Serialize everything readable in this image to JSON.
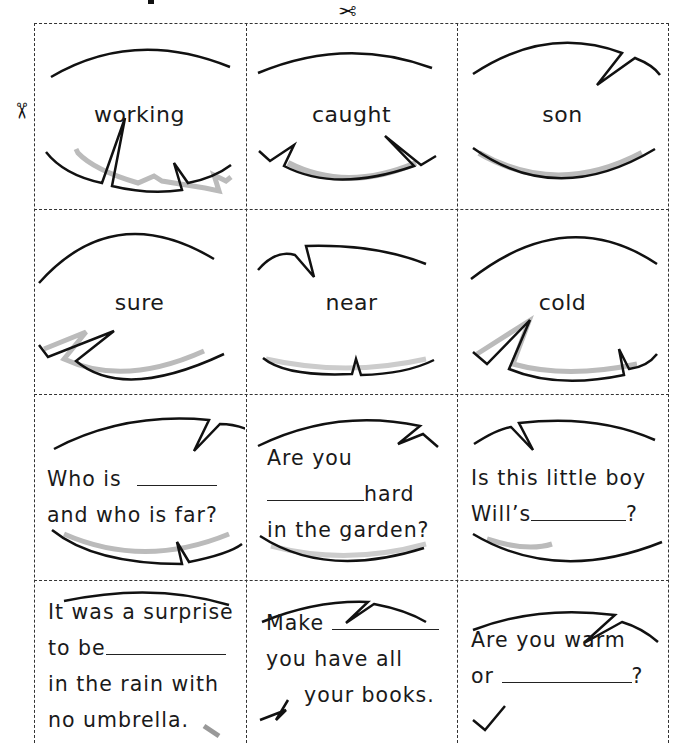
{
  "page": {
    "title_fragment": "",
    "icons": {
      "cut_top": "scissors-icon",
      "cut_left": "scissors-icon"
    }
  },
  "cards": {
    "words": [
      {
        "text": "working"
      },
      {
        "text": "caught"
      },
      {
        "text": "son"
      },
      {
        "text": "sure"
      },
      {
        "text": "near"
      },
      {
        "text": "cold"
      }
    ],
    "sentences": [
      {
        "lines": [
          {
            "before": "Who is ",
            "blank": true,
            "after": ""
          },
          {
            "before": "and who is far?",
            "blank": false,
            "after": ""
          }
        ]
      },
      {
        "lines": [
          {
            "before": "Are you",
            "blank": false,
            "after": ""
          },
          {
            "before": "",
            "blank": true,
            "after": "hard"
          },
          {
            "before": "in the garden?",
            "blank": false,
            "after": ""
          }
        ]
      },
      {
        "lines": [
          {
            "before": "Is this little boy",
            "blank": false,
            "after": ""
          },
          {
            "before": "Will’s",
            "blank": true,
            "after": "?"
          }
        ]
      },
      {
        "lines": [
          {
            "before": "It was a surprise",
            "blank": false,
            "after": ""
          },
          {
            "before": "to be",
            "blank": true,
            "after": ""
          },
          {
            "before": "in the rain with",
            "blank": false,
            "after": ""
          },
          {
            "before": "no umbrella.",
            "blank": false,
            "after": ""
          }
        ]
      },
      {
        "lines": [
          {
            "before": "Make ",
            "blank": true,
            "after": ""
          },
          {
            "before": "you have all",
            "blank": false,
            "after": ""
          },
          {
            "before": "your books.",
            "blank": false,
            "after": ""
          }
        ]
      },
      {
        "lines": [
          {
            "before": "Are you warm",
            "blank": false,
            "after": ""
          },
          {
            "before": "or ",
            "blank": true,
            "after": "?"
          }
        ]
      }
    ]
  },
  "text": {
    "w0": "working",
    "w1": "caught",
    "w2": "son",
    "w3": "sure",
    "w4": "near",
    "w5": "cold",
    "s0_l0_a": "Who is",
    "s0_l1": "and who is far?",
    "s1_l0": "Are you",
    "s1_l1_b": "hard",
    "s1_l2": "in the garden?",
    "s2_l0": "Is this little boy",
    "s2_l1_a": "Will’s",
    "s2_l1_b": "?",
    "s3_l0": "It was a surprise",
    "s3_l1_a": "to be",
    "s3_l2": "in the rain with",
    "s3_l3": "no umbrella.",
    "s4_l0_a": "Make",
    "s4_l1": "you have all",
    "s4_l2": "your books.",
    "s5_l0": "Are you warm",
    "s5_l1_a": "or",
    "s5_l1_b": "?"
  },
  "glyphs": {
    "scissors": "✂"
  }
}
